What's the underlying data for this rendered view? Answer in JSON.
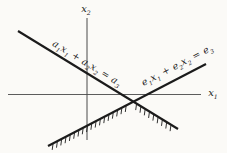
{
  "figure": {
    "colors": {
      "ink": "#1b1b1b",
      "axis": "#4a4a4a",
      "background": "#fbfaf7"
    },
    "labels": {
      "x2_axis": {
        "text": "x₂",
        "parts": [
          [
            "x",
            0
          ],
          [
            "2",
            1
          ]
        ]
      },
      "x1_axis": {
        "text": "x₁",
        "parts": [
          [
            "x",
            0
          ],
          [
            "1",
            1
          ]
        ]
      },
      "a_line": {
        "text": "a₁x₁ + a₂x₂ = a₃",
        "parts": [
          [
            "a",
            0
          ],
          [
            "1",
            1
          ],
          [
            "x",
            0
          ],
          [
            "1",
            1
          ],
          [
            " + ",
            0
          ],
          [
            "a",
            0
          ],
          [
            "2",
            1
          ],
          [
            "x",
            0
          ],
          [
            "2",
            1
          ],
          [
            " = ",
            0
          ],
          [
            "a",
            0
          ],
          [
            "3",
            1
          ]
        ]
      },
      "e_line": {
        "text": "e₁x₁ + e₂x₂ = e₃",
        "parts": [
          [
            "e",
            0
          ],
          [
            "1",
            1
          ],
          [
            "x",
            0
          ],
          [
            "1",
            1
          ],
          [
            " + ",
            0
          ],
          [
            "e",
            0
          ],
          [
            "2",
            1
          ],
          [
            "x",
            0
          ],
          [
            "2",
            1
          ],
          [
            " = ",
            0
          ],
          [
            "e",
            0
          ],
          [
            "3",
            1
          ]
        ]
      }
    }
  }
}
